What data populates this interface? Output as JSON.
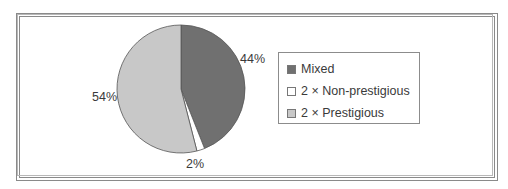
{
  "chart_data": {
    "type": "pie",
    "title": "",
    "categories": [
      "Mixed",
      "2 × Non-prestigious",
      "2 × Prestigious"
    ],
    "values": [
      44,
      2,
      54
    ],
    "labels": [
      "44%",
      "2%",
      "54%"
    ],
    "colors": [
      "#707070",
      "#ffffff",
      "#c8c8c8"
    ],
    "start_angle": "12 o'clock",
    "direction": "clockwise",
    "legend_position": "right"
  },
  "legend": {
    "items": [
      {
        "label": "Mixed",
        "color": "#707070"
      },
      {
        "label": "2 × Non-prestigious",
        "color": "#ffffff"
      },
      {
        "label": "2 × Prestigious",
        "color": "#c8c8c8"
      }
    ]
  }
}
